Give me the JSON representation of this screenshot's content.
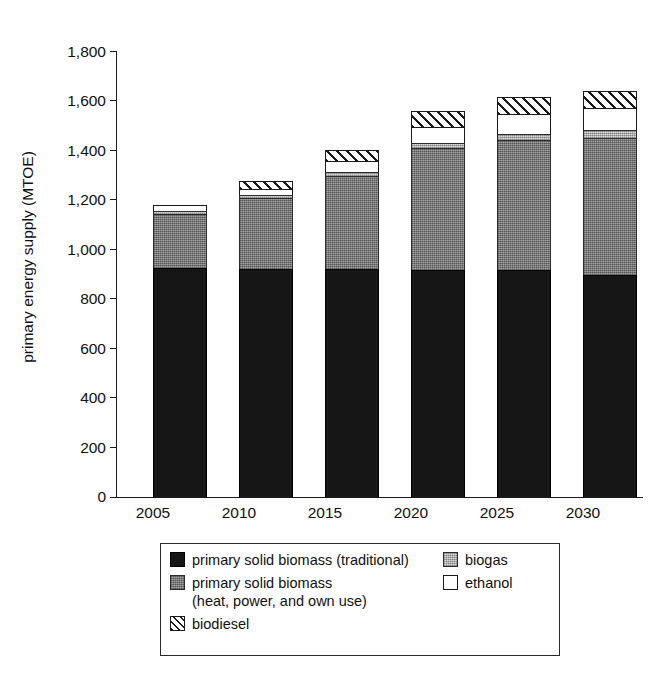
{
  "chart_data": {
    "type": "bar",
    "subtype": "stacked-bar",
    "title": "",
    "xlabel": "",
    "ylabel": "primary energy supply (MTOE)",
    "categories": [
      "2005",
      "2010",
      "2015",
      "2020",
      "2025",
      "2030"
    ],
    "ylim": [
      0,
      1800
    ],
    "ytick_step": 200,
    "ytick_labels": [
      "0",
      "200",
      "400",
      "600",
      "800",
      "1,000",
      "1,200",
      "1,400",
      "1,600",
      "1,800"
    ],
    "ytick_values": [
      0,
      200,
      400,
      600,
      800,
      1000,
      1200,
      1400,
      1600,
      1800
    ],
    "grid": false,
    "legend_position": "below-plot",
    "series": [
      {
        "name": "primary solid biomass (traditional)",
        "key": "traditional",
        "fill": "solid-black",
        "color": "#161616",
        "values": [
          925,
          920,
          920,
          915,
          915,
          895
        ]
      },
      {
        "name": "primary solid biomass (heat, power, and own use)",
        "key": "heatpower",
        "fill": "medium-gray",
        "color": "#8a8a8a",
        "values": [
          218,
          285,
          375,
          495,
          525,
          555
        ]
      },
      {
        "name": "biogas",
        "key": "biogas",
        "fill": "light-gray",
        "color": "#bdbdbd",
        "values": [
          12,
          12,
          15,
          20,
          25,
          30
        ]
      },
      {
        "name": "ethanol",
        "key": "ethanol",
        "fill": "white",
        "color": "#ffffff",
        "values": [
          23,
          25,
          45,
          65,
          80,
          90
        ]
      },
      {
        "name": "biodiesel",
        "key": "biodiesel",
        "fill": "diagonal-hatch",
        "color": "#ffffff",
        "values": [
          0,
          35,
          45,
          65,
          70,
          70
        ]
      }
    ],
    "totals": [
      1178,
      1277,
      1400,
      1560,
      1615,
      1640
    ]
  },
  "axis": {
    "y_title": "primary energy supply (MTOE)",
    "y_ticks": [
      {
        "label": "1,800",
        "value": 1800
      },
      {
        "label": "1,600",
        "value": 1600
      },
      {
        "label": "1,400",
        "value": 1400
      },
      {
        "label": "1,200",
        "value": 1200
      },
      {
        "label": "1,000",
        "value": 1000
      },
      {
        "label": "800",
        "value": 800
      },
      {
        "label": "600",
        "value": 600
      },
      {
        "label": "400",
        "value": 400
      },
      {
        "label": "200",
        "value": 200
      },
      {
        "label": "0",
        "value": 0
      }
    ],
    "x_ticks": [
      "2005",
      "2010",
      "2015",
      "2020",
      "2025",
      "2030"
    ]
  },
  "legend": {
    "left_column": [
      {
        "label": "primary solid biomass (traditional)",
        "swatch": "solid-black-swatch"
      },
      {
        "label": "primary solid biomass",
        "label2": "(heat, power, and own use)",
        "swatch": "medium-gray-swatch"
      },
      {
        "label": "biodiesel",
        "swatch": "diagonal-hatch-swatch"
      }
    ],
    "right_column": [
      {
        "label": "biogas",
        "swatch": "light-gray-swatch"
      },
      {
        "label": "ethanol",
        "swatch": "white-swatch"
      }
    ]
  }
}
